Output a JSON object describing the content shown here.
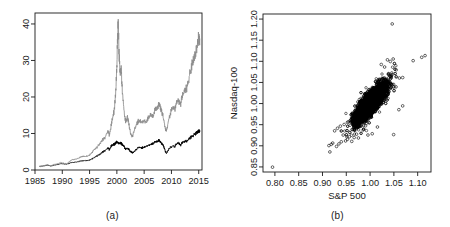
{
  "figure": {
    "width": 450,
    "height": 227,
    "background": "#ffffff",
    "panels": [
      {
        "id": "a",
        "caption": "(a)"
      },
      {
        "id": "b",
        "caption": "(b)"
      }
    ]
  },
  "colors": {
    "axis": "#1a1a1a",
    "text": "#1a1a1a",
    "series_black": "#000000",
    "series_gray": "#8c8c8c",
    "point_stroke": "#000000",
    "background": "#ffffff"
  },
  "chart_data": [
    {
      "panel": "a",
      "type": "line",
      "title": "",
      "caption": "(a)",
      "xlabel": "",
      "ylabel": "",
      "xlim": [
        1985,
        2015.6
      ],
      "ylim": [
        0,
        43
      ],
      "xticks": [
        1985,
        1990,
        1995,
        2000,
        2005,
        2010,
        2015
      ],
      "xtick_labels": [
        "1985",
        "1990",
        "1995",
        "2000",
        "2005",
        "2010",
        "2015"
      ],
      "yticks": [
        0,
        10,
        20,
        30,
        40
      ],
      "ytick_labels": [
        "0",
        "10",
        "20",
        "30",
        "40"
      ],
      "ytick_rotated": true,
      "grid": false,
      "legend": "none",
      "series": [
        {
          "name": "Nasdaq-100",
          "color": "#8c8c8c",
          "x": [
            1985.8,
            1986.3,
            1986.8,
            1987.3,
            1987.6,
            1987.9,
            1988.3,
            1988.8,
            1989.3,
            1989.8,
            1990.3,
            1990.8,
            1991.3,
            1991.8,
            1992.3,
            1992.8,
            1993.3,
            1993.8,
            1994.3,
            1994.8,
            1995.3,
            1995.8,
            1996.3,
            1996.8,
            1997.3,
            1997.8,
            1998.3,
            1998.6,
            1998.9,
            1999.2,
            1999.5,
            1999.8,
            2000.0,
            2000.1,
            2000.25,
            2000.4,
            2000.6,
            2000.8,
            2001.0,
            2001.3,
            2001.6,
            2001.9,
            2002.2,
            2002.5,
            2002.8,
            2003.0,
            2003.4,
            2003.8,
            2004.2,
            2004.6,
            2005.0,
            2005.4,
            2005.8,
            2006.2,
            2006.6,
            2007.0,
            2007.4,
            2007.7,
            2008.0,
            2008.3,
            2008.6,
            2008.9,
            2009.1,
            2009.4,
            2009.8,
            2010.2,
            2010.6,
            2011.0,
            2011.4,
            2011.7,
            2012.0,
            2012.4,
            2012.8,
            2013.2,
            2013.6,
            2014.0,
            2014.4,
            2014.8,
            2015.0,
            2015.2
          ],
          "y": [
            1.0,
            1.1,
            1.3,
            1.5,
            1.3,
            1.2,
            1.5,
            1.6,
            1.9,
            2.1,
            1.9,
            1.7,
            2.3,
            2.9,
            3.0,
            3.2,
            3.6,
            3.9,
            3.8,
            4.0,
            4.6,
            5.6,
            6.3,
            7.2,
            8.4,
            9.0,
            10.8,
            10.0,
            12.0,
            14.5,
            16.5,
            22.0,
            29.0,
            36.0,
            42.0,
            33.0,
            27.0,
            28.0,
            22.0,
            17.0,
            13.5,
            15.0,
            13.0,
            10.5,
            9.5,
            10.0,
            12.0,
            13.5,
            14.0,
            13.2,
            13.8,
            13.5,
            14.8,
            15.5,
            15.2,
            16.8,
            17.5,
            18.8,
            17.5,
            16.0,
            14.0,
            11.5,
            11.0,
            13.5,
            16.0,
            17.5,
            17.0,
            19.5,
            19.0,
            18.5,
            21.0,
            22.5,
            23.0,
            26.0,
            28.5,
            31.0,
            33.0,
            35.5,
            37.5,
            36.0
          ]
        },
        {
          "name": "S&P 500",
          "color": "#000000",
          "x": [
            1985.8,
            1986.3,
            1986.8,
            1987.3,
            1987.6,
            1987.9,
            1988.3,
            1988.8,
            1989.3,
            1989.8,
            1990.3,
            1990.8,
            1991.3,
            1991.8,
            1992.3,
            1992.8,
            1993.3,
            1993.8,
            1994.3,
            1994.8,
            1995.3,
            1995.8,
            1996.3,
            1996.8,
            1997.3,
            1997.8,
            1998.3,
            1998.6,
            1998.9,
            1999.2,
            1999.5,
            1999.8,
            2000.0,
            2000.2,
            2000.5,
            2000.8,
            2001.0,
            2001.3,
            2001.6,
            2001.9,
            2002.2,
            2002.5,
            2002.8,
            2003.0,
            2003.4,
            2003.8,
            2004.2,
            2004.6,
            2005.0,
            2005.4,
            2005.8,
            2006.2,
            2006.6,
            2007.0,
            2007.4,
            2007.7,
            2008.0,
            2008.3,
            2008.6,
            2008.9,
            2009.1,
            2009.4,
            2009.8,
            2010.2,
            2010.6,
            2011.0,
            2011.4,
            2011.7,
            2012.0,
            2012.4,
            2012.8,
            2013.2,
            2013.6,
            2014.0,
            2014.4,
            2014.8,
            2015.0,
            2015.2
          ],
          "y": [
            1.0,
            1.1,
            1.2,
            1.4,
            1.2,
            1.1,
            1.3,
            1.4,
            1.6,
            1.8,
            1.7,
            1.6,
            1.9,
            2.1,
            2.2,
            2.3,
            2.5,
            2.6,
            2.6,
            2.7,
            3.0,
            3.4,
            3.9,
            4.3,
            5.0,
            5.4,
            6.1,
            5.8,
            6.6,
            7.0,
            7.2,
            7.6,
            7.9,
            7.7,
            7.5,
            7.6,
            7.0,
            6.6,
            5.8,
            6.2,
            5.8,
            5.2,
            4.9,
            5.0,
            5.6,
            6.1,
            6.3,
            6.2,
            6.5,
            6.6,
            6.9,
            7.2,
            7.4,
            7.9,
            8.1,
            8.3,
            7.9,
            7.4,
            6.6,
            5.2,
            4.6,
            5.6,
            6.3,
            6.8,
            6.6,
            7.4,
            7.5,
            7.0,
            7.7,
            8.0,
            8.1,
            8.8,
            9.3,
            9.8,
            10.2,
            10.7,
            11.1,
            10.9
          ]
        }
      ]
    },
    {
      "panel": "b",
      "type": "scatter",
      "title": "",
      "caption": "(b)",
      "xlabel": "S&P 500",
      "ylabel": "Nasdaq-100",
      "xlim": [
        0.775,
        1.128
      ],
      "ylim": [
        0.838,
        1.212
      ],
      "xticks": [
        0.8,
        0.85,
        0.9,
        0.95,
        1.0,
        1.05,
        1.1
      ],
      "xtick_labels": [
        "0.80",
        "0.85",
        "0.90",
        "0.95",
        "1.00",
        "1.05",
        "1.10"
      ],
      "yticks": [
        0.85,
        0.9,
        0.95,
        1.0,
        1.05,
        1.1,
        1.15,
        1.2
      ],
      "ytick_labels": [
        "0.85",
        "0.90",
        "0.95",
        "1.00",
        "1.05",
        "1.10",
        "1.15",
        "1.20"
      ],
      "ytick_rotated": true,
      "grid": false,
      "legend": "none",
      "marker": "open-circle",
      "n_points": 7500,
      "cloud": {
        "center_x": 1.0005,
        "center_y": 1.0,
        "sd_x": 0.0115,
        "sd_y": 0.0165,
        "correlation": 0.83
      },
      "outliers": [
        [
          0.795,
          0.8495
        ],
        [
          0.9155,
          0.8855
        ],
        [
          0.9135,
          0.9005
        ],
        [
          0.9185,
          0.9035
        ],
        [
          0.9215,
          0.9065
        ],
        [
          0.9295,
          0.8985
        ],
        [
          0.9345,
          0.9045
        ],
        [
          0.9395,
          0.9095
        ],
        [
          0.9435,
          0.9255
        ],
        [
          0.9485,
          0.9115
        ],
        [
          0.9525,
          0.9155
        ],
        [
          0.9565,
          0.9215
        ],
        [
          0.9615,
          0.9105
        ],
        [
          0.9665,
          0.9195
        ],
        [
          0.9715,
          0.9275
        ],
        [
          0.9255,
          0.9355
        ],
        [
          0.9315,
          0.9415
        ],
        [
          0.9375,
          0.9465
        ],
        [
          0.9455,
          0.9505
        ],
        [
          0.9525,
          0.9555
        ],
        [
          1.0465,
          1.1885
        ],
        [
          1.0365,
          1.1035
        ],
        [
          1.0425,
          1.0995
        ],
        [
          1.0485,
          1.1055
        ],
        [
          1.0235,
          1.0925
        ],
        [
          1.0305,
          1.0865
        ],
        [
          1.0905,
          1.1015
        ],
        [
          1.1085,
          1.1095
        ],
        [
          1.1155,
          1.1135
        ],
        [
          1.0615,
          1.0605
        ],
        [
          1.0685,
          1.0615
        ],
        [
          1.0505,
          1.0305
        ],
        [
          1.0545,
          1.0395
        ],
        [
          1.0495,
          0.9265
        ],
        [
          0.9955,
          0.9255
        ],
        [
          1.0045,
          0.9285
        ],
        [
          0.9755,
          0.9185
        ],
        [
          0.9855,
          0.9375
        ],
        [
          1.0155,
          0.9445
        ],
        [
          0.9905,
          0.9475
        ],
        [
          1.0685,
          0.9945
        ],
        [
          1.0605,
          0.9855
        ]
      ]
    }
  ]
}
